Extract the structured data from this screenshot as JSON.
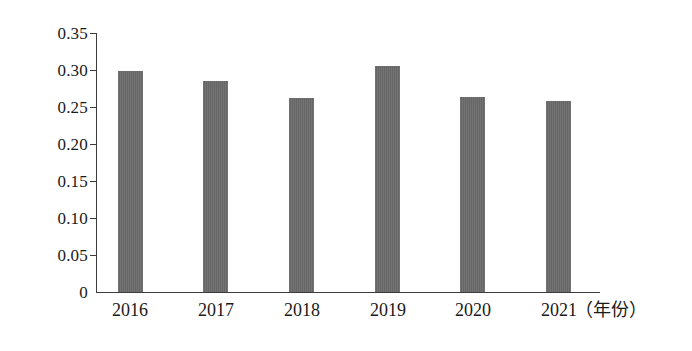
{
  "chart_data": {
    "type": "bar",
    "title": "",
    "subtitle": "",
    "xlabel": "（年份）",
    "ylabel": "",
    "categories": [
      "2016",
      "2017",
      "2018",
      "2019",
      "2020",
      "2021"
    ],
    "values": [
      0.298,
      0.285,
      0.262,
      0.306,
      0.264,
      0.258
    ],
    "series": [
      {
        "name": "",
        "values": [
          0.298,
          0.285,
          0.262,
          0.306,
          0.264,
          0.258
        ]
      }
    ],
    "ylim": [
      0,
      0.35
    ],
    "y_ticks": [
      0,
      0.05,
      0.1,
      0.15,
      0.2,
      0.25,
      0.3,
      0.35
    ],
    "y_tick_labels": [
      "0",
      "0.05",
      "0.10",
      "0.15",
      "0.20",
      "0.25",
      "0.30",
      "0.35"
    ],
    "grid": false,
    "legend": false,
    "legend_position": "none",
    "annotations": [],
    "bar_color": "#6b6b6b",
    "axis_color": "#3c3c3c"
  },
  "axis": {
    "y_labels": [
      "0.35",
      "0.30",
      "0.25",
      "0.20",
      "0.15",
      "0.10",
      "0.05",
      "0"
    ],
    "x_labels": [
      "2016",
      "2017",
      "2018",
      "2019",
      "2020",
      "2021"
    ],
    "x_unit": "（年份）"
  }
}
